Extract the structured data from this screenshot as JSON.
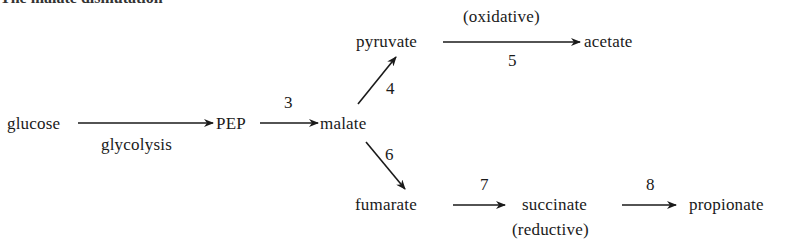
{
  "caption_clipped": "The malate dismutation",
  "nodes": {
    "glucose": "glucose",
    "pep": "PEP",
    "malate": "malate",
    "pyruvate": "pyruvate",
    "acetate": "acetate",
    "fumarate": "fumarate",
    "succinate": "succinate",
    "propionate": "propionate"
  },
  "edge_labels": {
    "glycolysis": "glycolysis",
    "step3": "3",
    "step4": "4",
    "step5": "5",
    "oxidative": "(oxidative)",
    "step6": "6",
    "step7": "7",
    "step8": "8",
    "reductive": "(reductive)"
  },
  "edges": [
    {
      "from": "glucose",
      "to": "PEP",
      "label": "glycolysis"
    },
    {
      "from": "PEP",
      "to": "malate",
      "label": "3"
    },
    {
      "from": "malate",
      "to": "pyruvate",
      "label": "4"
    },
    {
      "from": "pyruvate",
      "to": "acetate",
      "label": "5",
      "note": "(oxidative)"
    },
    {
      "from": "malate",
      "to": "fumarate",
      "label": "6"
    },
    {
      "from": "fumarate",
      "to": "succinate",
      "label": "7"
    },
    {
      "from": "succinate",
      "to": "propionate",
      "label": "8",
      "note": "(reductive)"
    }
  ]
}
